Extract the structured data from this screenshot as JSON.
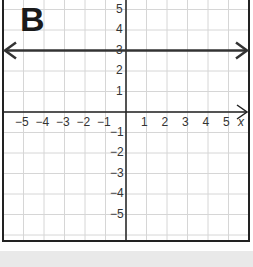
{
  "chart_data": {
    "type": "line",
    "title": "B",
    "xlabel": "x",
    "ylabel": "",
    "xlim": [
      -6,
      6
    ],
    "ylim": [
      -6,
      6
    ],
    "grid": true,
    "x_ticks": [
      "-5",
      "-4",
      "-3",
      "-2",
      "-1",
      "1",
      "2",
      "3",
      "4",
      "5"
    ],
    "y_ticks": [
      "5",
      "4",
      "3",
      "2",
      "1",
      "-1",
      "-2",
      "-3",
      "-4",
      "-5"
    ],
    "series": [
      {
        "name": "y = 3",
        "equation": "y = 3",
        "x": [
          -6,
          6
        ],
        "values": [
          3,
          3
        ],
        "arrows": "both"
      }
    ]
  },
  "panel_label": "B",
  "axis_label_x": "x",
  "colors": {
    "grid": "#d6d6d6",
    "axis": "#222222",
    "line": "#333333",
    "band": "#e9e9e9"
  }
}
